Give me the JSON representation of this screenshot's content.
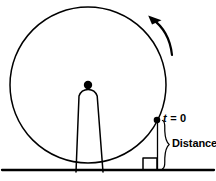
{
  "figure": {
    "kind": "rolling-wheel-diagram",
    "background_color": "#ffffff",
    "stroke_color": "#000000",
    "labels": {
      "time_zero": "t = 0",
      "time_zero_variable": "t",
      "time_zero_equals_value": "= 0",
      "distance": "Distance"
    },
    "wheel": {
      "center_x": 88,
      "center_y": 85,
      "radius": 78,
      "stroke_width": 1.4
    },
    "hub_dot": {
      "center_x": 88,
      "center_y": 85,
      "radius": 4.2,
      "fill": "#000000"
    },
    "mark_point": {
      "center_x": 157,
      "center_y": 120,
      "radius": 3.2,
      "fill": "#000000"
    },
    "ground": {
      "y": 170,
      "x_start": 2,
      "x_end": 214,
      "stroke_width": 2.2
    },
    "rotation_arrow": {
      "direction": "counterclockwise",
      "tip_x": 149,
      "tip_y": 16
    },
    "brace": {
      "x": 165,
      "top_y": 120,
      "bottom_y": 170,
      "tip_y": 145
    },
    "block": {
      "x": 143,
      "y": 158,
      "width": 14,
      "height": 12
    }
  }
}
